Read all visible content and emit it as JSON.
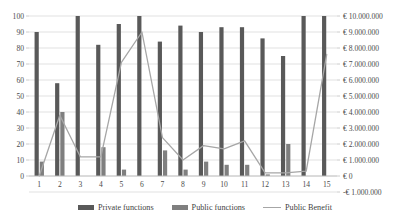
{
  "chart_data": {
    "type": "bar",
    "title": "",
    "subtitle": "",
    "xlabel": "",
    "ylabel": "",
    "y2label": "",
    "grid": true,
    "legend_position": "bottom",
    "categories": [
      "1",
      "2",
      "3",
      "4",
      "5",
      "6",
      "7",
      "8",
      "9",
      "10",
      "11",
      "12",
      "13",
      "14",
      "15"
    ],
    "ylim": [
      0,
      100
    ],
    "yticks": [
      0,
      10,
      20,
      30,
      40,
      50,
      60,
      70,
      80,
      90,
      100
    ],
    "ytick_labels": [
      "0",
      "10",
      "20",
      "30",
      "40",
      "50",
      "60",
      "70",
      "80",
      "90",
      "100"
    ],
    "y2lim": [
      -1000000,
      10000000
    ],
    "y2ticks": [
      -1000000,
      0,
      1000000,
      2000000,
      3000000,
      4000000,
      5000000,
      6000000,
      7000000,
      8000000,
      9000000,
      10000000
    ],
    "y2tick_labels": [
      "-€ 1.000.000",
      "€ 0",
      "€ 1.000.000",
      "€ 2.000.000",
      "€ 3.000.000",
      "€ 4.000.000",
      "€ 5.000.000",
      "€ 6.000.000",
      "€ 7.000.000",
      "€ 8.000.000",
      "€ 9.000.000",
      "€ 10.000.000"
    ],
    "series": [
      {
        "name": "Private functions",
        "type": "bar",
        "axis": "left",
        "color": "#595959",
        "values": [
          90,
          58,
          100,
          82,
          95,
          100,
          84,
          94,
          90,
          93,
          93,
          86,
          75,
          100,
          100
        ]
      },
      {
        "name": "Public functions",
        "type": "bar",
        "axis": "left",
        "color": "#7f7f7f",
        "values": [
          9,
          40,
          0,
          18,
          4,
          0,
          16,
          4,
          9,
          7,
          7,
          1,
          20,
          0,
          0
        ]
      },
      {
        "name": "Public Benefit",
        "type": "line",
        "axis": "right",
        "color": "#a6a6a6",
        "values": [
          0,
          3800000,
          1200000,
          1200000,
          7100000,
          9000000,
          2400000,
          1000000,
          1900000,
          1700000,
          2200000,
          200000,
          200000,
          300000,
          7600000
        ]
      }
    ]
  },
  "legend": {
    "items": [
      {
        "label": "Private functions",
        "kind": "bar",
        "color": "#595959"
      },
      {
        "label": "Public functions",
        "kind": "bar",
        "color": "#7f7f7f"
      },
      {
        "label": "Public Benefit",
        "kind": "line",
        "color": "#a6a6a6"
      }
    ]
  },
  "colors": {
    "private_bar": "#595959",
    "public_bar": "#7f7f7f",
    "benefit_line": "#a6a6a6",
    "grid": "#d9d9d9",
    "axis": "#bfbfbf",
    "text": "#4a4a4a",
    "background": "#ffffff"
  }
}
